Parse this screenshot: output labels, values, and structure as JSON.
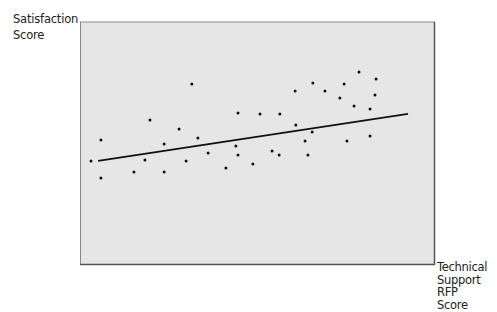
{
  "chart_data": {
    "type": "scatter",
    "title": "",
    "xlabel": "Technical Support RFP Score",
    "ylabel": "Satisfaction Score",
    "xlabel_lines": [
      "Technical",
      "Support RFP",
      "Score"
    ],
    "ylabel_lines": [
      "Satisfaction",
      "Score"
    ],
    "x_ticks": [],
    "y_ticks": [],
    "grid": false,
    "legend": null,
    "note": "No axis ticks or numeric labels are shown; coordinates are on an assumed normalized 0-100 scale estimated from point positions in the plot area.",
    "xlim": [
      0,
      100
    ],
    "ylim": [
      0,
      100
    ],
    "points": [
      {
        "x": 3.1,
        "y": 42.6
      },
      {
        "x": 5.9,
        "y": 51.2
      },
      {
        "x": 5.9,
        "y": 35.5
      },
      {
        "x": 15.2,
        "y": 38.0
      },
      {
        "x": 18.3,
        "y": 43.0
      },
      {
        "x": 19.7,
        "y": 59.5
      },
      {
        "x": 23.7,
        "y": 49.6
      },
      {
        "x": 23.7,
        "y": 38.0
      },
      {
        "x": 27.9,
        "y": 55.8
      },
      {
        "x": 29.9,
        "y": 42.6
      },
      {
        "x": 31.5,
        "y": 74.4
      },
      {
        "x": 33.2,
        "y": 52.1
      },
      {
        "x": 36.1,
        "y": 45.9
      },
      {
        "x": 41.1,
        "y": 39.7
      },
      {
        "x": 44.5,
        "y": 62.4
      },
      {
        "x": 43.9,
        "y": 48.8
      },
      {
        "x": 44.5,
        "y": 45.0
      },
      {
        "x": 48.7,
        "y": 41.3
      },
      {
        "x": 50.7,
        "y": 62.0
      },
      {
        "x": 54.1,
        "y": 46.7
      },
      {
        "x": 56.3,
        "y": 62.0
      },
      {
        "x": 56.1,
        "y": 45.0
      },
      {
        "x": 60.6,
        "y": 71.5
      },
      {
        "x": 60.8,
        "y": 57.4
      },
      {
        "x": 63.4,
        "y": 50.8
      },
      {
        "x": 64.2,
        "y": 45.0
      },
      {
        "x": 65.4,
        "y": 54.5
      },
      {
        "x": 65.6,
        "y": 74.8
      },
      {
        "x": 69.0,
        "y": 71.5
      },
      {
        "x": 74.4,
        "y": 74.4
      },
      {
        "x": 73.2,
        "y": 68.6
      },
      {
        "x": 75.2,
        "y": 50.8
      },
      {
        "x": 77.2,
        "y": 65.3
      },
      {
        "x": 78.6,
        "y": 79.3
      },
      {
        "x": 83.4,
        "y": 76.4
      },
      {
        "x": 81.7,
        "y": 52.9
      },
      {
        "x": 83.1,
        "y": 69.8
      },
      {
        "x": 81.7,
        "y": 64.0
      }
    ],
    "trendline": {
      "type": "linear",
      "start": {
        "x": 5.1,
        "y": 42.6
      },
      "end": {
        "x": 92.4,
        "y": 62.0
      }
    },
    "colors": {
      "plot_background": "#e6e6e6",
      "plot_border": "#7a7a7a",
      "points": "#111111",
      "trendline": "#111111"
    }
  },
  "plot_px": {
    "left": 80,
    "top": 22,
    "right": 435,
    "bottom": 264
  }
}
